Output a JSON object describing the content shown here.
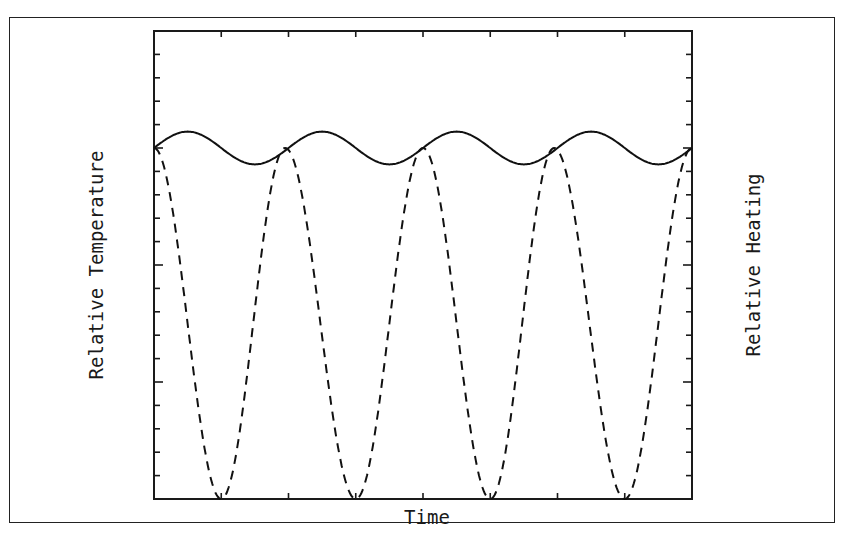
{
  "chart_data": {
    "type": "line",
    "title": "",
    "xlabel": "Time",
    "ylabel": "Relative Temperature",
    "ylabel_right": "Relative Heating",
    "grid": false,
    "legend": null,
    "x_ticks_count": 8,
    "y_ticks_count": 20,
    "xlim": [
      0,
      8
    ],
    "ylim": [
      0,
      1
    ],
    "series": [
      {
        "name": "Relative Temperature",
        "style": "solid",
        "axis": "left",
        "description": "Small-amplitude sinusoid around ~0.75 of axis height, ~4 cycles, lagging the heating",
        "x": [
          0,
          0.5,
          1,
          1.5,
          2,
          2.5,
          3,
          3.5,
          4,
          4.5,
          5,
          5.5,
          6,
          6.5,
          7,
          7.5,
          8
        ],
        "values": [
          0.75,
          0.785,
          0.75,
          0.715,
          0.75,
          0.785,
          0.75,
          0.715,
          0.75,
          0.785,
          0.75,
          0.715,
          0.75,
          0.785,
          0.75,
          0.715,
          0.75
        ]
      },
      {
        "name": "Relative Heating",
        "style": "dashed",
        "axis": "right",
        "description": "Large-amplitude periodic heating touching zero at minima, ~4 cycles",
        "x": [
          0,
          1,
          1.95,
          3,
          4,
          5,
          5.95,
          7,
          8
        ],
        "values": [
          0.75,
          0.0,
          0.75,
          0.0,
          0.75,
          0.0,
          0.75,
          0.0,
          0.75
        ]
      }
    ]
  },
  "labels": {
    "x_axis": "Time",
    "y_axis_left": "Relative Temperature",
    "y_axis_right": "Relative Heating"
  }
}
